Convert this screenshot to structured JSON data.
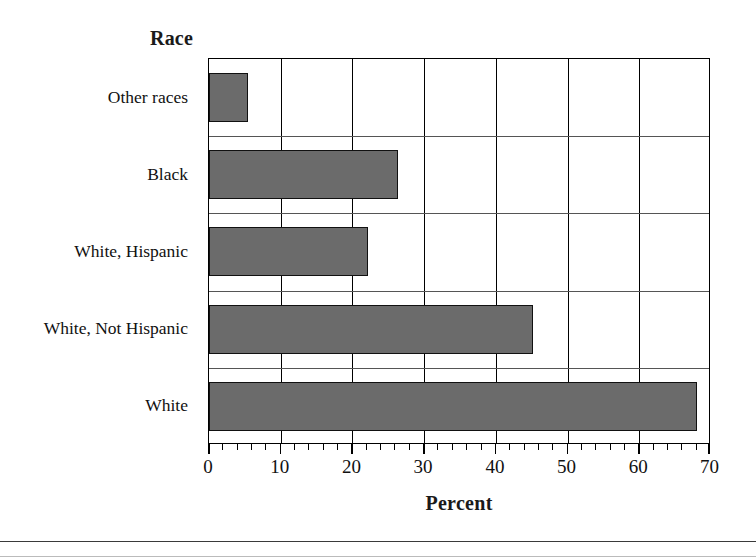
{
  "chart_data": {
    "type": "bar",
    "orientation": "horizontal",
    "title": "Race",
    "xlabel": "Percent",
    "ylabel": "Race",
    "categories": [
      "White",
      "White, Not Hispanic",
      "White, Hispanic",
      "Black",
      "Other races"
    ],
    "values": [
      68.3,
      45.3,
      22.2,
      26.5,
      5.5
    ],
    "display_order_top_to_bottom": [
      "Other races",
      "Black",
      "White, Hispanic",
      "White, Not Hispanic",
      "White"
    ],
    "xlim": [
      0,
      70
    ],
    "xticks": [
      0,
      10,
      20,
      30,
      40,
      50,
      60,
      70
    ],
    "xticklabels": [
      "0",
      "10",
      "20",
      "30",
      "40",
      "50",
      "60",
      "70"
    ],
    "minor_tick_step": 2,
    "grid": "vertical gridlines at each major x tick; light horizontal separators between categories",
    "legend": "none",
    "bar_fill_color": "#6b6b6b",
    "bar_edge_color": "#111111",
    "axis_color": "#000000",
    "background_color": "#ffffff"
  },
  "labels": {
    "title": "Race",
    "xaxis_title": "Percent",
    "categories_top_to_bottom": [
      "Other races",
      "Black",
      "White, Hispanic",
      "White, Not Hispanic",
      "White"
    ],
    "xticklabels": [
      "0",
      "10",
      "20",
      "30",
      "40",
      "50",
      "60",
      "70"
    ]
  }
}
